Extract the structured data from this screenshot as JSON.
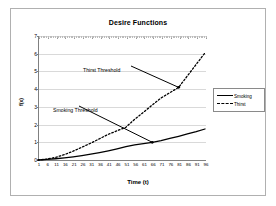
{
  "chart_data": {
    "type": "line",
    "title": "Desire Functions",
    "xlabel": "Time (t)",
    "ylabel": "f(x)",
    "xlim": [
      1,
      96
    ],
    "ylim": [
      0,
      7
    ],
    "grid": true,
    "legend_position": "right",
    "xticks": [
      1,
      6,
      11,
      16,
      21,
      26,
      31,
      36,
      41,
      46,
      51,
      56,
      61,
      66,
      71,
      76,
      81,
      86,
      91,
      96
    ],
    "yticks": [
      0,
      1,
      2,
      3,
      4,
      5,
      6,
      7
    ],
    "x": [
      1,
      6,
      11,
      16,
      21,
      26,
      31,
      36,
      41,
      46,
      51,
      56,
      61,
      66,
      71,
      76,
      81,
      86,
      91,
      96
    ],
    "series": [
      {
        "name": "Smoking",
        "style": "solid",
        "color": "#000000",
        "values": [
          0.0,
          0.03,
          0.07,
          0.12,
          0.18,
          0.25,
          0.33,
          0.42,
          0.52,
          0.63,
          0.75,
          0.85,
          0.92,
          1.0,
          1.1,
          1.22,
          1.34,
          1.47,
          1.6,
          1.75
        ]
      },
      {
        "name": "Thirst",
        "style": "dashed",
        "color": "#000000",
        "values": [
          0.0,
          0.05,
          0.15,
          0.3,
          0.5,
          0.72,
          0.95,
          1.2,
          1.45,
          1.65,
          1.85,
          2.3,
          2.7,
          3.1,
          3.5,
          3.8,
          4.1,
          4.75,
          5.4,
          6.05
        ]
      }
    ],
    "annotations": [
      {
        "text": "Thirst Threshold",
        "points_to_series": "Thirst",
        "points_to_x": 81,
        "points_to_y": 4.1
      },
      {
        "text": "Smoking Threshold",
        "points_to_series": "Smoking",
        "points_to_x": 66,
        "points_to_y": 1.0
      }
    ]
  },
  "legend": {
    "items": [
      {
        "label": "Smoking",
        "style": "solid"
      },
      {
        "label": "Thirst",
        "style": "dashed"
      }
    ]
  }
}
